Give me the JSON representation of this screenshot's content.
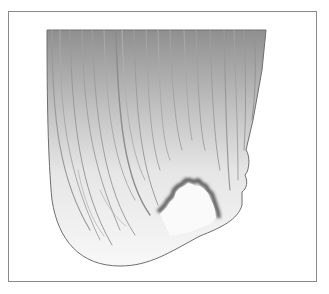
{
  "figure": {
    "colors": {
      "frame_border": "#8a8a8a",
      "top_shade": "#8f8f8f",
      "bottom_shade": "#f7f7f7",
      "outline": "#6e6e6e",
      "notch_shadow": "#5a5a5a"
    }
  }
}
